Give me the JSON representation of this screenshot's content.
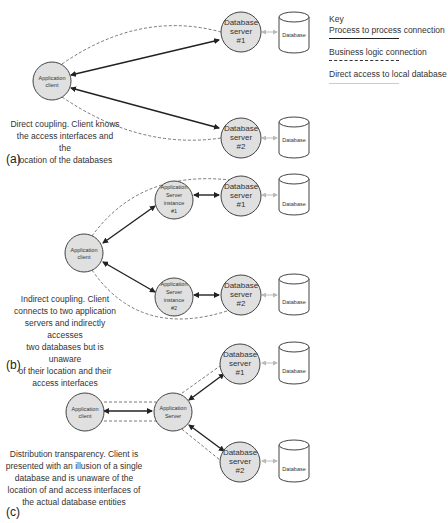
{
  "key": {
    "title": "Key",
    "items": [
      {
        "label": "Process to process connection",
        "style": "solid"
      },
      {
        "label": "Business logic connection",
        "style": "dashed"
      },
      {
        "label": "Direct access to local database",
        "style": "light"
      }
    ]
  },
  "colors": {
    "node_fill": "#e0e0e0",
    "node_stroke": "#444444",
    "process_line": "#222222",
    "logic_line": "#555555",
    "db_access_line": "#bbbbbb"
  },
  "panels": [
    {
      "letter": "(a)",
      "caption": [
        "Direct coupling. Client knows",
        "the access interfaces and the",
        "location of the databases"
      ],
      "nodes": {
        "client": [
          "Application",
          "client"
        ],
        "db_server_1": [
          "Database",
          "server",
          "#1"
        ],
        "db_server_2": [
          "Database",
          "server",
          "#2"
        ],
        "database_1": "Database",
        "database_2": "Database"
      }
    },
    {
      "letter": "(b)",
      "caption": [
        "Indirect coupling. Client",
        "connects to two application",
        "servers and indirectly accesses",
        "two databases but is unaware",
        "of their location and their",
        "access interfaces"
      ],
      "nodes": {
        "client": [
          "Application",
          "client"
        ],
        "app_server_1": [
          "Application",
          "Server",
          "instance",
          "#1"
        ],
        "app_server_2": [
          "Application",
          "Server",
          "instance",
          "#2"
        ],
        "db_server_1": [
          "Database",
          "server",
          "#1"
        ],
        "db_server_2": [
          "Database",
          "server",
          "#2"
        ],
        "database_1": "Database",
        "database_2": "Database"
      }
    },
    {
      "letter": "(c)",
      "caption": [
        "Distribution transparency. Client is",
        "presented with an illusion of a single",
        "database and is unaware of the",
        "location of and access interfaces of",
        "the actual database entities"
      ],
      "nodes": {
        "client": [
          "Application",
          "client"
        ],
        "app_server": [
          "Application",
          "Server"
        ],
        "db_server_1": [
          "Database",
          "server",
          "#1"
        ],
        "db_server_2": [
          "Database",
          "server",
          "#2"
        ],
        "database_1": "Database",
        "database_2": "Database"
      }
    }
  ]
}
